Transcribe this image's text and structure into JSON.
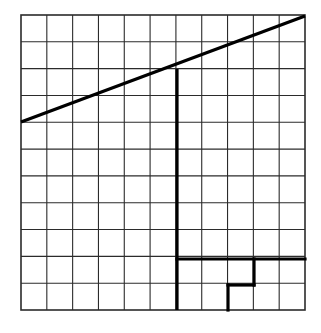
{
  "figure": {
    "title": "Grid with diagonal line and bold step outline",
    "background_color": "#ffffff",
    "width": 321,
    "height": 333
  },
  "grid": {
    "name": "square-grid",
    "columns": 11,
    "rows": 11,
    "x_start": 21,
    "y_start": 15,
    "x_end": 305,
    "y_end": 310,
    "cell_width": 25.82,
    "cell_height": 26.82,
    "line_color": "#2b2b2b",
    "line_width": 1.1,
    "border_color": "#2b2b2b",
    "border_width": 1.6
  },
  "bold": {
    "color": "#000000",
    "width": 3.2
  },
  "shapes": {
    "diagonal_line": {
      "name": "diagonal-line",
      "x1": 21,
      "y1": 122,
      "x2": 305,
      "y2": 16,
      "description": "Rising straight line from left edge to top-right corner"
    },
    "vertical_bold_line": {
      "name": "bold-vertical-line",
      "x": 177,
      "y1": 69,
      "y2": 310,
      "description": "Bold vertical line at column 6 boundary from diagonal down to base"
    },
    "step_outline": {
      "name": "bold-step-outline",
      "points": "177,259 305,259",
      "segments": [
        {
          "name": "upper-horizontal",
          "x1": 177,
          "y1": 259,
          "x2": 305,
          "y2": 259
        },
        {
          "name": "step-vertical",
          "x1": 254,
          "y1": 259,
          "x2": 254,
          "y2": 285
        },
        {
          "name": "lower-horizontal",
          "x1": 228,
          "y1": 285,
          "x2": 254,
          "y2": 285
        },
        {
          "name": "bottom-vertical",
          "x1": 228,
          "y1": 285,
          "x2": 228,
          "y2": 310
        }
      ],
      "description": "Bold descending staircase in the lower right region"
    }
  },
  "chart_data": {
    "type": "line",
    "title": "Grid with diagonal line and bold step outline",
    "xlabel": "",
    "ylabel": "",
    "grid": true,
    "legend": "none",
    "xlim": [
      0,
      11
    ],
    "ylim": [
      0,
      11
    ],
    "x_ticks": [
      0,
      1,
      2,
      3,
      4,
      5,
      6,
      7,
      8,
      9,
      10,
      11
    ],
    "y_ticks": [
      0,
      1,
      2,
      3,
      4,
      5,
      6,
      7,
      8,
      9,
      10,
      11
    ],
    "series": [
      {
        "name": "diagonal",
        "type": "line",
        "x": [
          0,
          11
        ],
        "y": [
          7,
          11
        ]
      },
      {
        "name": "vertical-drop",
        "type": "line",
        "x": [
          6,
          6
        ],
        "y": [
          9,
          0
        ]
      },
      {
        "name": "step-outline",
        "type": "line",
        "x": [
          6,
          11,
          11,
          9,
          9,
          8,
          8
        ],
        "y": [
          2,
          2,
          2,
          2,
          1,
          1,
          0
        ]
      }
    ]
  }
}
